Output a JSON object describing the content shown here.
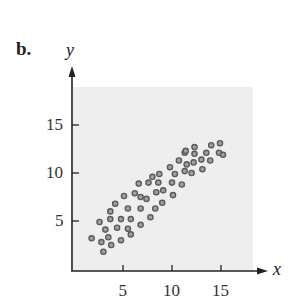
{
  "figure": {
    "panel_label": "b.",
    "x_axis_label": "x",
    "y_axis_label": "y"
  },
  "chart_data": {
    "type": "scatter",
    "title": "",
    "xlabel": "x",
    "ylabel": "y",
    "x_ticks": [
      5,
      10,
      15
    ],
    "y_ticks": [
      5,
      10,
      15
    ],
    "xlim": [
      0,
      19
    ],
    "ylim": [
      0,
      21
    ],
    "grid": false,
    "legend": null,
    "background_shading": "#eeeeee",
    "point_color": "#5a5a5a",
    "points": [
      [
        1.8,
        3.2
      ],
      [
        2.8,
        2.8
      ],
      [
        3.0,
        1.8
      ],
      [
        3.5,
        3.3
      ],
      [
        3.8,
        2.5
      ],
      [
        3.2,
        4.1
      ],
      [
        2.6,
        4.9
      ],
      [
        3.7,
        5.2
      ],
      [
        3.7,
        6.0
      ],
      [
        4.2,
        6.8
      ],
      [
        4.4,
        4.3
      ],
      [
        4.8,
        3.0
      ],
      [
        4.8,
        5.2
      ],
      [
        5.1,
        7.6
      ],
      [
        5.5,
        6.3
      ],
      [
        5.5,
        4.2
      ],
      [
        5.8,
        5.2
      ],
      [
        5.8,
        3.6
      ],
      [
        6.2,
        7.9
      ],
      [
        6.8,
        7.5
      ],
      [
        6.8,
        6.3
      ],
      [
        6.8,
        4.6
      ],
      [
        7.4,
        7.3
      ],
      [
        7.8,
        5.4
      ],
      [
        8.3,
        6.3
      ],
      [
        8.4,
        8.0
      ],
      [
        9.1,
        8.2
      ],
      [
        9.0,
        6.9
      ],
      [
        6.6,
        8.9
      ],
      [
        7.6,
        9.0
      ],
      [
        8.0,
        9.6
      ],
      [
        8.7,
        9.9
      ],
      [
        8.6,
        9.0
      ],
      [
        10.0,
        9.0
      ],
      [
        10.1,
        7.7
      ],
      [
        9.8,
        10.6
      ],
      [
        10.3,
        9.9
      ],
      [
        10.7,
        11.3
      ],
      [
        11.0,
        8.8
      ],
      [
        11.3,
        12.1
      ],
      [
        11.3,
        10.2
      ],
      [
        11.5,
        10.9
      ],
      [
        11.4,
        12.3
      ],
      [
        12.0,
        10.0
      ],
      [
        12.2,
        11.1
      ],
      [
        12.3,
        12.7
      ],
      [
        12.3,
        12.0
      ],
      [
        13.0,
        11.4
      ],
      [
        13.1,
        10.4
      ],
      [
        13.5,
        12.1
      ],
      [
        13.9,
        11.3
      ],
      [
        14.0,
        12.9
      ],
      [
        14.8,
        12.1
      ],
      [
        14.9,
        13.1
      ],
      [
        15.2,
        11.9
      ]
    ]
  }
}
